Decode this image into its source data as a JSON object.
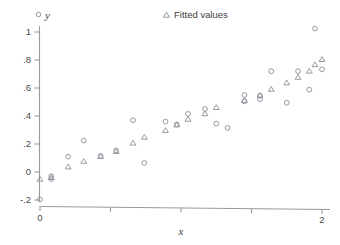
{
  "chart_data": {
    "type": "scatter",
    "title": "",
    "xlabel": "x",
    "ylabel": "y",
    "xlim": [
      -0.04,
      2.1
    ],
    "ylim": [
      -0.24,
      1.08
    ],
    "grid": false,
    "legend_position": "top",
    "xticks": [
      0,
      0.5,
      1,
      1.5,
      2
    ],
    "xtick_labels": [
      "0",
      "",
      "",
      "",
      "2"
    ],
    "yticks": [
      -0.2,
      0,
      0.2,
      0.4,
      0.6,
      0.8,
      1
    ],
    "ytick_labels": [
      "-.2",
      "0",
      ".2",
      ".4",
      ".6",
      ".8",
      "1"
    ],
    "series": [
      {
        "name": "y",
        "marker": "circle",
        "color": "#8e8e99",
        "points": [
          [
            0.0,
            -0.195
          ],
          [
            0.08,
            -0.03
          ],
          [
            0.08,
            -0.05
          ],
          [
            0.2,
            0.11
          ],
          [
            0.31,
            0.225
          ],
          [
            0.43,
            0.115
          ],
          [
            0.54,
            0.155
          ],
          [
            0.66,
            0.37
          ],
          [
            0.74,
            0.065
          ],
          [
            0.89,
            0.36
          ],
          [
            0.97,
            0.34
          ],
          [
            1.05,
            0.415
          ],
          [
            1.17,
            0.45
          ],
          [
            1.25,
            0.345
          ],
          [
            1.33,
            0.315
          ],
          [
            1.45,
            0.55
          ],
          [
            1.45,
            0.505
          ],
          [
            1.56,
            0.52
          ],
          [
            1.56,
            0.545
          ],
          [
            1.64,
            0.72
          ],
          [
            1.75,
            0.495
          ],
          [
            1.83,
            0.72
          ],
          [
            1.91,
            0.588
          ],
          [
            1.95,
            1.025
          ],
          [
            2.0,
            0.733
          ]
        ]
      },
      {
        "name": "Fitted values",
        "marker": "triangle",
        "color": "#8e8e99",
        "points": [
          [
            0.0,
            -0.05
          ],
          [
            0.08,
            -0.038
          ],
          [
            0.2,
            0.038
          ],
          [
            0.31,
            0.078
          ],
          [
            0.43,
            0.112
          ],
          [
            0.54,
            0.148
          ],
          [
            0.66,
            0.208
          ],
          [
            0.74,
            0.25
          ],
          [
            0.89,
            0.298
          ],
          [
            0.97,
            0.338
          ],
          [
            1.05,
            0.378
          ],
          [
            1.17,
            0.418
          ],
          [
            1.25,
            0.462
          ],
          [
            1.45,
            0.512
          ],
          [
            1.56,
            0.548
          ],
          [
            1.64,
            0.592
          ],
          [
            1.75,
            0.638
          ],
          [
            1.83,
            0.678
          ],
          [
            1.91,
            0.722
          ],
          [
            1.95,
            0.768
          ],
          [
            2.0,
            0.805
          ]
        ]
      }
    ]
  },
  "legend": {
    "y_marker_name": "circle-marker",
    "y_label": "y",
    "fitted_marker_name": "triangle-marker",
    "fitted_label": "Fitted values"
  },
  "axes": {
    "x_title": "x",
    "y_title": "y"
  }
}
